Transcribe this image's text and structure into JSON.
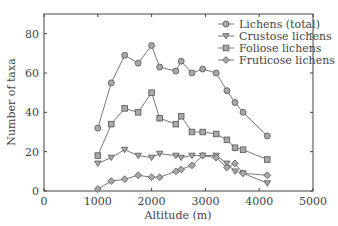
{
  "chart_data": {
    "type": "line",
    "title": "",
    "xlabel": "Altitude (m)",
    "ylabel": "Number of taxa",
    "xlim": [
      0,
      5000
    ],
    "ylim": [
      0,
      90
    ],
    "xticks": [
      0,
      1000,
      2000,
      3000,
      4000,
      5000
    ],
    "yticks": [
      0,
      20,
      40,
      60,
      80
    ],
    "grid": false,
    "legend_position": "upper right",
    "x": [
      1000,
      1250,
      1500,
      1750,
      2000,
      2150,
      2450,
      2550,
      2750,
      2950,
      3200,
      3400,
      3550,
      3700,
      4150
    ],
    "series": [
      {
        "name": "Lichens (total)",
        "marker": "circle",
        "values": [
          32,
          55,
          69,
          65,
          74,
          63,
          61,
          66,
          60,
          62,
          60,
          51,
          45,
          40,
          28
        ]
      },
      {
        "name": "Crustose lichens",
        "marker": "triangle-down",
        "values": [
          14,
          17,
          21,
          18,
          17,
          19,
          18,
          17,
          18,
          18,
          18,
          14,
          10,
          9,
          4
        ]
      },
      {
        "name": "Foliose lichens",
        "marker": "square",
        "values": [
          18,
          34,
          42,
          40,
          50,
          37,
          34,
          38,
          30,
          30,
          29,
          26,
          22,
          21,
          16
        ]
      },
      {
        "name": "Fruticose lichens",
        "marker": "diamond",
        "values": [
          1,
          5,
          6,
          8,
          7,
          7,
          10,
          11,
          13,
          18,
          17,
          12,
          14,
          9,
          8
        ]
      }
    ]
  },
  "colors": {
    "marker_fill": "#a8a8a8",
    "line": "#555555",
    "axis": "#444444"
  }
}
